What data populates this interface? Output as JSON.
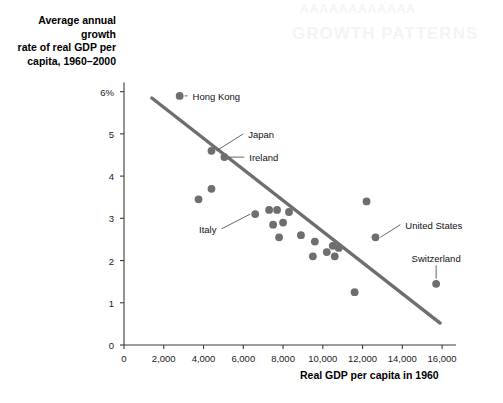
{
  "bleed_through": {
    "line1": "AAAAAAAAAAAA",
    "line2": "GROWTH PATTERNS"
  },
  "axes": {
    "y_title": "Average annual growth\nrate of real GDP per\ncapita, 1960–2000",
    "x_title": "Real GDP per capita in 1960",
    "y_ticks": [
      "0",
      "1",
      "2",
      "3",
      "4",
      "5",
      "6%"
    ],
    "x_ticks": [
      "0",
      "2,000",
      "4,000",
      "6,000",
      "8,000",
      "10,000",
      "12,000",
      "14,000",
      "16,000"
    ]
  },
  "style": {
    "point_color": "#6e6e6e",
    "line_color": "#6e6e6e",
    "axis_color": "#3a3a3a",
    "leader_color": "#555555"
  },
  "chart_data": {
    "type": "scatter",
    "title": "",
    "xlabel": "Real GDP per capita in 1960",
    "ylabel": "Average annual growth rate of real GDP per capita, 1960–2000",
    "xlim": [
      0,
      16800
    ],
    "ylim": [
      0,
      6.3
    ],
    "xticks": [
      0,
      2000,
      4000,
      6000,
      8000,
      10000,
      12000,
      14000,
      16000
    ],
    "yticks": [
      0,
      1,
      2,
      3,
      4,
      5,
      6
    ],
    "grid": false,
    "legend": "none",
    "points": [
      {
        "x": 2800,
        "y": 5.9,
        "label": "Hong Kong",
        "label_x": 3400,
        "label_y": 5.9,
        "leader": true
      },
      {
        "x": 4400,
        "y": 4.6,
        "label": "Japan",
        "label_x": 6200,
        "label_y": 5.0,
        "leader": true
      },
      {
        "x": 5050,
        "y": 4.45,
        "label": "Ireland",
        "label_x": 6250,
        "label_y": 4.45,
        "leader": true
      },
      {
        "x": 4400,
        "y": 3.7,
        "label": "",
        "leader": false
      },
      {
        "x": 3750,
        "y": 3.45,
        "label": "",
        "leader": false
      },
      {
        "x": 6600,
        "y": 3.1,
        "label": "Italy",
        "label_x": 4700,
        "label_y": 2.75,
        "leader": true
      },
      {
        "x": 7300,
        "y": 3.2,
        "label": "",
        "leader": false
      },
      {
        "x": 7700,
        "y": 3.2,
        "label": "",
        "leader": false
      },
      {
        "x": 7500,
        "y": 2.85,
        "label": "",
        "leader": false
      },
      {
        "x": 8000,
        "y": 2.9,
        "label": "",
        "leader": false
      },
      {
        "x": 7800,
        "y": 2.55,
        "label": "",
        "leader": false
      },
      {
        "x": 8300,
        "y": 3.15,
        "label": "",
        "leader": false
      },
      {
        "x": 8900,
        "y": 2.6,
        "label": "",
        "leader": false
      },
      {
        "x": 9600,
        "y": 2.45,
        "label": "",
        "leader": false
      },
      {
        "x": 9500,
        "y": 2.1,
        "label": "",
        "leader": false
      },
      {
        "x": 10200,
        "y": 2.2,
        "label": "",
        "leader": false
      },
      {
        "x": 10500,
        "y": 2.35,
        "label": "",
        "leader": false
      },
      {
        "x": 10800,
        "y": 2.3,
        "label": "",
        "leader": false
      },
      {
        "x": 10600,
        "y": 2.1,
        "label": "",
        "leader": false
      },
      {
        "x": 12200,
        "y": 3.4,
        "label": "",
        "leader": false
      },
      {
        "x": 12650,
        "y": 2.55,
        "label": "United States",
        "label_x": 14100,
        "label_y": 2.85,
        "leader": true
      },
      {
        "x": 11600,
        "y": 1.25,
        "label": "",
        "leader": false
      },
      {
        "x": 15700,
        "y": 1.45,
        "label": "Switzerland",
        "label_x": 15700,
        "label_y": 2.05,
        "leader": true
      }
    ],
    "trend_line": {
      "x0": 1400,
      "y0": 5.85,
      "x1": 15900,
      "y1": 0.52
    }
  }
}
